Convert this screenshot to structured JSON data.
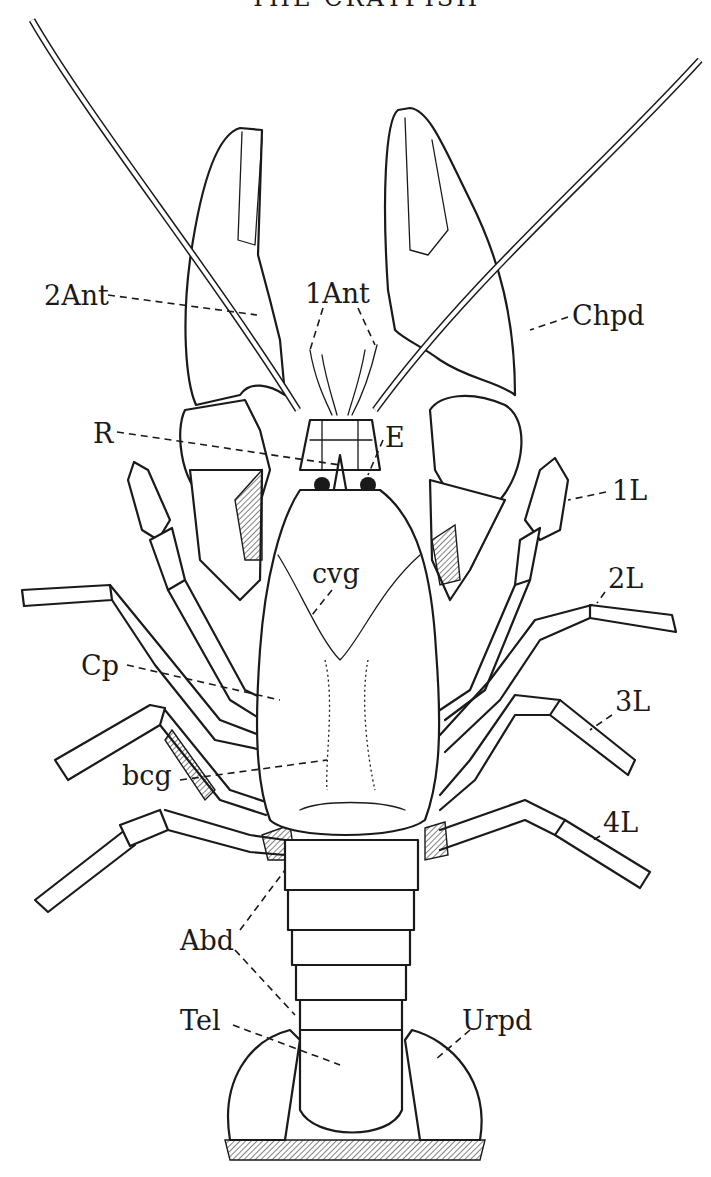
{
  "figure": {
    "title_partial": "THE CRAYFISH",
    "ink_color": "#1a1a1a",
    "background_color": "#ffffff"
  },
  "labels": [
    {
      "id": "2Ant",
      "text": "2Ant",
      "x": 44,
      "y": 305,
      "meaning": "second antenna"
    },
    {
      "id": "1Ant",
      "text": "1Ant",
      "x": 305,
      "y": 303,
      "meaning": "first antenna"
    },
    {
      "id": "Chpd",
      "text": "Chpd",
      "x": 572,
      "y": 325,
      "meaning": "cheliped"
    },
    {
      "id": "R",
      "text": "R",
      "x": 93,
      "y": 443,
      "meaning": "rostrum"
    },
    {
      "id": "E",
      "text": "E",
      "x": 385,
      "y": 447,
      "meaning": "eye"
    },
    {
      "id": "1L",
      "text": "1L",
      "x": 612,
      "y": 500,
      "meaning": "first walking leg"
    },
    {
      "id": "cvg",
      "text": "cvg",
      "x": 312,
      "y": 583,
      "meaning": "cervical groove"
    },
    {
      "id": "2L",
      "text": "2L",
      "x": 608,
      "y": 588,
      "meaning": "second walking leg"
    },
    {
      "id": "Cp",
      "text": "Cp",
      "x": 81,
      "y": 675,
      "meaning": "carapace"
    },
    {
      "id": "3L",
      "text": "3L",
      "x": 615,
      "y": 711,
      "meaning": "third walking leg"
    },
    {
      "id": "bcg",
      "text": "bcg",
      "x": 122,
      "y": 785,
      "meaning": "branchio-cardiac groove"
    },
    {
      "id": "4L",
      "text": "4L",
      "x": 603,
      "y": 832,
      "meaning": "fourth walking leg"
    },
    {
      "id": "Abd",
      "text": "Abd",
      "x": 180,
      "y": 950,
      "meaning": "abdomen"
    },
    {
      "id": "Tel",
      "text": "Tel",
      "x": 180,
      "y": 1030,
      "meaning": "telson"
    },
    {
      "id": "Urpd",
      "text": "Urpd",
      "x": 462,
      "y": 1030,
      "meaning": "uropod"
    }
  ]
}
